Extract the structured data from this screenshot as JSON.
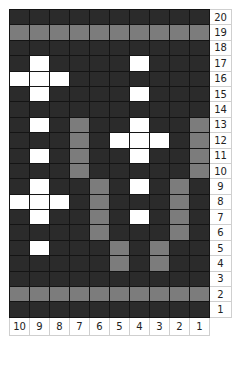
{
  "chart_data": {
    "type": "heatmap",
    "title": "",
    "legend": {
      "0": "dark",
      "1": "white",
      "2": "gray"
    },
    "colors": {
      "dark": "#2b2b2b",
      "white": "#ffffff",
      "gray": "#7c7c7c",
      "gridline": "#141414"
    },
    "column_labels": [
      "10",
      "9",
      "8",
      "7",
      "6",
      "5",
      "4",
      "3",
      "2",
      "1"
    ],
    "row_labels": [
      "20",
      "19",
      "18",
      "17",
      "16",
      "15",
      "14",
      "13",
      "12",
      "11",
      "10",
      "9",
      "8",
      "7",
      "6",
      "5",
      "4",
      "3",
      "2",
      "1"
    ],
    "rows": [
      [
        0,
        0,
        0,
        0,
        0,
        0,
        0,
        0,
        0,
        0
      ],
      [
        2,
        2,
        2,
        2,
        2,
        2,
        2,
        2,
        2,
        2
      ],
      [
        0,
        0,
        0,
        0,
        0,
        0,
        0,
        0,
        0,
        0
      ],
      [
        0,
        1,
        0,
        0,
        0,
        0,
        1,
        0,
        0,
        0
      ],
      [
        1,
        1,
        1,
        0,
        0,
        0,
        0,
        0,
        0,
        0
      ],
      [
        0,
        1,
        0,
        0,
        0,
        0,
        1,
        0,
        0,
        0
      ],
      [
        0,
        0,
        0,
        0,
        0,
        0,
        0,
        0,
        0,
        0
      ],
      [
        0,
        1,
        0,
        2,
        0,
        0,
        1,
        0,
        0,
        2
      ],
      [
        0,
        0,
        0,
        2,
        0,
        1,
        1,
        1,
        0,
        2
      ],
      [
        0,
        1,
        0,
        2,
        0,
        0,
        1,
        0,
        0,
        2
      ],
      [
        0,
        0,
        0,
        2,
        0,
        0,
        0,
        0,
        0,
        2
      ],
      [
        0,
        1,
        0,
        0,
        2,
        0,
        1,
        0,
        2,
        0
      ],
      [
        1,
        1,
        1,
        0,
        2,
        0,
        0,
        0,
        2,
        0
      ],
      [
        0,
        1,
        0,
        0,
        2,
        0,
        1,
        0,
        2,
        0
      ],
      [
        0,
        0,
        0,
        0,
        2,
        0,
        0,
        0,
        2,
        0
      ],
      [
        0,
        1,
        0,
        0,
        0,
        2,
        0,
        2,
        0,
        0
      ],
      [
        0,
        0,
        0,
        0,
        0,
        2,
        0,
        2,
        0,
        0
      ],
      [
        0,
        0,
        0,
        0,
        0,
        0,
        0,
        0,
        0,
        0
      ],
      [
        2,
        2,
        2,
        2,
        2,
        2,
        2,
        2,
        2,
        2
      ],
      [
        0,
        0,
        0,
        0,
        0,
        0,
        0,
        0,
        0,
        0
      ]
    ]
  }
}
